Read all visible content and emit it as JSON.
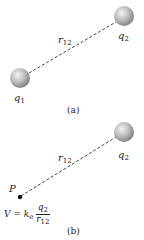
{
  "figure_a": {
    "charge1": {
      "symbol": "q",
      "subscript": "1"
    },
    "charge2": {
      "symbol": "q",
      "subscript": "2"
    },
    "distance": {
      "symbol": "r",
      "subscript": "12"
    },
    "caption": "(a)"
  },
  "figure_b": {
    "point": {
      "label": "P"
    },
    "charge2": {
      "symbol": "q",
      "subscript": "2"
    },
    "distance": {
      "symbol": "r",
      "subscript": "12"
    },
    "formula": {
      "lhs": "V = ",
      "constant": "k",
      "constant_subscript": "e",
      "numerator_symbol": "q",
      "numerator_subscript": "2",
      "denominator_symbol": "r",
      "denominator_subscript": "12"
    },
    "caption": "(b)"
  },
  "colors": {
    "sphere_light": "#e6e6e6",
    "sphere_dark": "#8a8a8a",
    "line": "#444444",
    "text": "#222222"
  }
}
